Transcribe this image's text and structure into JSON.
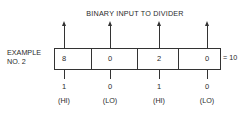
{
  "title": "BINARY INPUT TO DIVIDER",
  "example_label_line1": "EXAMPLE",
  "example_label_line2": "NO. 2",
  "cells": [
    "8",
    "0",
    "2",
    "0"
  ],
  "equals": "= 10",
  "bits": [
    "1",
    "0",
    "1",
    "0"
  ],
  "levels": [
    "(HI)",
    "(LO)",
    "(HI)",
    "(LO)"
  ]
}
